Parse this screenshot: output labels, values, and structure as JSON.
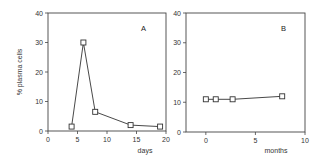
{
  "chart_data": [
    {
      "type": "line",
      "panel_label": "A",
      "title": "",
      "xlabel": "days",
      "ylabel": "% plasma cells",
      "xlim": [
        0,
        20
      ],
      "ylim": [
        0,
        40
      ],
      "xticks": [
        "0",
        "5",
        "10",
        "15",
        "20"
      ],
      "yticks": [
        "0",
        "10",
        "20",
        "30",
        "40"
      ],
      "grid": false,
      "marker": "open-square",
      "series": [
        {
          "name": "A",
          "x": [
            4,
            6,
            8,
            14,
            19
          ],
          "y": [
            1.5,
            30,
            6.5,
            2,
            1.5
          ]
        }
      ]
    },
    {
      "type": "line",
      "panel_label": "B",
      "title": "",
      "xlabel": "months",
      "ylabel": "",
      "xlim": [
        -2,
        10
      ],
      "ylim": [
        0,
        40
      ],
      "xticks": [
        "0",
        "5",
        "10"
      ],
      "yticks": [
        "0",
        "10",
        "20",
        "30",
        "40"
      ],
      "grid": false,
      "marker": "open-square",
      "series": [
        {
          "name": "B",
          "x": [
            0,
            1,
            2.7,
            7.7
          ],
          "y": [
            11,
            11,
            11,
            12
          ]
        }
      ]
    }
  ]
}
